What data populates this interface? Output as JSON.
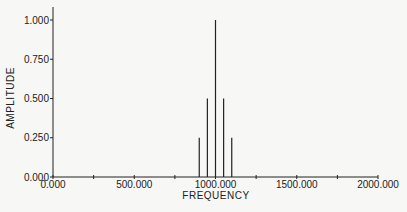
{
  "chart_data": {
    "type": "bar",
    "title": "",
    "xlabel": "FREQUENCY",
    "ylabel": "AMPLITUDE",
    "xlim": [
      0,
      2000
    ],
    "ylim": [
      0,
      1.0
    ],
    "grid": false,
    "x_ticks": [
      "0.000",
      "500.000",
      "1000.000",
      "1500.000",
      "2000.000"
    ],
    "y_ticks": [
      "0.000",
      "0.250",
      "0.500",
      "0.750",
      "1.000"
    ],
    "x": [
      900,
      950,
      1000,
      1050,
      1100
    ],
    "values": [
      0.25,
      0.5,
      1.0,
      0.5,
      0.25
    ]
  },
  "colors": {
    "ink": "#222222",
    "background": "#f7f7f5"
  }
}
